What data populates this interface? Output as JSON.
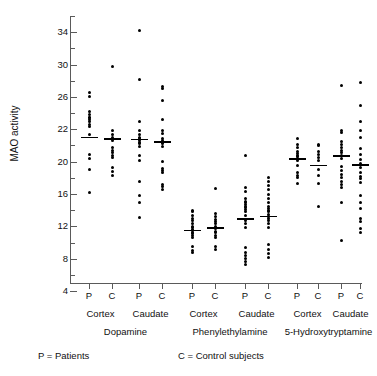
{
  "chart_data": {
    "type": "scatter",
    "title": "",
    "xlabel": "",
    "ylabel": "MAO activity",
    "ylim": [
      3,
      36
    ],
    "grid": false,
    "legend_position": "below-axis",
    "y_ticks_major": [
      34,
      30,
      26,
      22,
      20,
      16,
      12,
      8,
      4
    ],
    "y_tick_minor_step": 2,
    "y_axis_note": "Printed major tick labels, top to bottom: 34, 30, 26, 22, 20, 16, 12, 8, 4",
    "group_labels": [
      "P",
      "C"
    ],
    "region_labels": [
      "Cortex",
      "Caudate"
    ],
    "substrate_labels": [
      "Dopamine",
      "Phenylethylamine",
      "5-Hydroxytryptamine"
    ],
    "legend": [
      {
        "key": "P",
        "eq": "=",
        "label": "Patients"
      },
      {
        "key": "C",
        "eq": "=",
        "label": "Control subjects"
      }
    ],
    "series": [
      {
        "name": "Dopamine Cortex P",
        "substrate": "Dopamine",
        "region": "Cortex",
        "group": "P",
        "mean": 21.1,
        "values": [
          26.5,
          26.0,
          24.2,
          23.8,
          23.5,
          23.4,
          23.2,
          22.9,
          22.6,
          22.4,
          21.3,
          18.9,
          18.4,
          17.0,
          14.2
        ]
      },
      {
        "name": "Dopamine Cortex C",
        "substrate": "Dopamine",
        "region": "Cortex",
        "group": "C",
        "mean": 20.9,
        "values": [
          29.7,
          21.8,
          21.3,
          21.0,
          20.6,
          19.7,
          19.4,
          19.1,
          18.8,
          18.5,
          17.3,
          16.8,
          16.3
        ]
      },
      {
        "name": "Dopamine Caudate P",
        "substrate": "Dopamine",
        "region": "Caudate",
        "group": "P",
        "mean": 20.8,
        "values": [
          34.2,
          28.2,
          23.0,
          21.9,
          21.4,
          21.0,
          20.8,
          20.6,
          20.4,
          20.2,
          19.9,
          18.8,
          18.2,
          15.6,
          13.8,
          13.0,
          11.1
        ]
      },
      {
        "name": "Dopamine Caudate C",
        "substrate": "Dopamine",
        "region": "Caudate",
        "group": "C",
        "mean": 20.5,
        "values": [
          27.3,
          27.0,
          25.5,
          23.2,
          21.9,
          21.5,
          20.8,
          20.6,
          20.4,
          20.2,
          19.9,
          18.0,
          17.2,
          16.9,
          16.6,
          15.2,
          14.9,
          14.5
        ]
      },
      {
        "name": "Phenylethylamine Cortex P",
        "substrate": "Phenylethylamine",
        "region": "Cortex",
        "group": "P",
        "mean": 9.6,
        "values": [
          12.0,
          11.8,
          11.4,
          11.0,
          10.7,
          10.3,
          10.0,
          9.8,
          9.6,
          9.5,
          9.3,
          9.1,
          8.9,
          8.6,
          7.5,
          7.0,
          6.8
        ]
      },
      {
        "name": "Phenylethylamine Cortex C",
        "substrate": "Phenylethylamine",
        "region": "Cortex",
        "group": "C",
        "mean": 9.9,
        "values": [
          14.7,
          11.6,
          11.2,
          10.8,
          10.6,
          10.3,
          10.0,
          9.7,
          9.4,
          9.2,
          8.9,
          8.6,
          7.5,
          7.1
        ]
      },
      {
        "name": "Phenylethylamine Caudate P",
        "substrate": "Phenylethylamine",
        "region": "Caudate",
        "group": "P",
        "mean": 11.0,
        "values": [
          18.7,
          14.8,
          14.3,
          13.4,
          13.1,
          12.9,
          12.7,
          12.5,
          12.3,
          12.1,
          11.8,
          11.4,
          10.7,
          10.3,
          9.9,
          7.4,
          6.8,
          6.4,
          6.0,
          5.6,
          5.3
        ]
      },
      {
        "name": "Phenylethylamine Caudate C",
        "substrate": "Phenylethylamine",
        "region": "Caudate",
        "group": "C",
        "mean": 11.3,
        "values": [
          16.0,
          15.6,
          15.1,
          14.6,
          14.0,
          13.4,
          12.9,
          12.4,
          12.2,
          12.0,
          11.8,
          11.5,
          11.2,
          11.0,
          10.7,
          10.4,
          9.8,
          7.8,
          7.2,
          6.7,
          6.2
        ]
      },
      {
        "name": "5-Hydroxytryptamine Cortex P",
        "substrate": "5-Hydroxytryptamine",
        "region": "Cortex",
        "group": "P",
        "mean": 18.4,
        "values": [
          20.8,
          20.1,
          19.7,
          19.3,
          19.0,
          18.8,
          18.6,
          18.4,
          18.2,
          17.5,
          16.6,
          16.3,
          16.1,
          15.3
        ]
      },
      {
        "name": "5-Hydroxytryptamine Cortex C",
        "substrate": "5-Hydroxytryptamine",
        "region": "Cortex",
        "group": "C",
        "mean": 17.6,
        "values": [
          20.1,
          20.0,
          19.2,
          18.9,
          18.5,
          18.1,
          17.0,
          16.3,
          15.3,
          12.5
        ]
      },
      {
        "name": "5-Hydroxytryptamine Caudate P",
        "substrate": "5-Hydroxytryptamine",
        "region": "Caudate",
        "group": "P",
        "mean": 18.8,
        "values": [
          27.4,
          21.8,
          21.6,
          20.5,
          20.1,
          19.7,
          19.4,
          19.1,
          18.8,
          18.4,
          17.4,
          16.9,
          16.4,
          16.0,
          15.6,
          15.2,
          14.8,
          13.0,
          8.3
        ]
      },
      {
        "name": "5-Hydroxytryptamine Caudate C",
        "substrate": "5-Hydroxytryptamine",
        "region": "Caudate",
        "group": "C",
        "mean": 17.7,
        "values": [
          27.8,
          24.9,
          22.9,
          21.8,
          21.0,
          19.6,
          18.9,
          18.3,
          17.8,
          17.3,
          16.6,
          16.2,
          15.9,
          15.4,
          13.8,
          13.0,
          12.2,
          11.0,
          10.6,
          9.7,
          9.3
        ]
      }
    ]
  }
}
